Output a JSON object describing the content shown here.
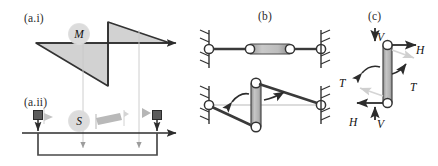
{
  "figure": {
    "background_color": "#ffffff",
    "stroke_color": "#333333",
    "fill_gray": "#cfcfcf",
    "ghost_gray": "#d9d9d9"
  },
  "panels": {
    "a_i": {
      "label": "(a.i)",
      "variable": "M",
      "caption_meaning": "bending-moment diagram"
    },
    "a_ii": {
      "label": "(a.ii)",
      "variable": "S",
      "caption_meaning": "shear-force diagram"
    },
    "b": {
      "label": "(b)",
      "caption_meaning": "pin-jointed link, undeformed and rotated"
    },
    "c": {
      "label": "(c)",
      "caption_meaning": "free-body diagram of the link",
      "forces": {
        "v_top": "V",
        "h_top": "H",
        "t_left": "T",
        "t_right": "T",
        "h_bottom": "H",
        "v_bottom": "V"
      }
    }
  }
}
